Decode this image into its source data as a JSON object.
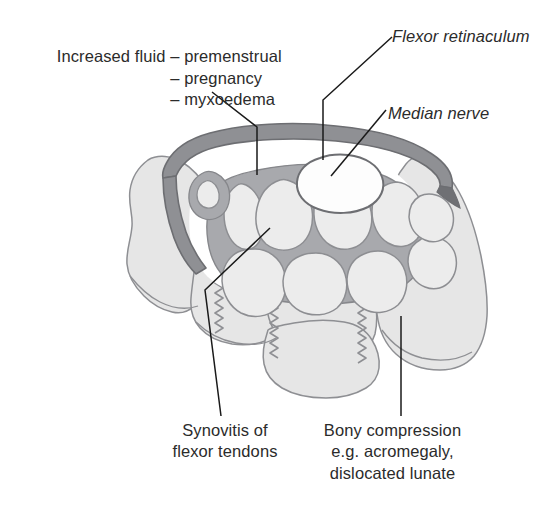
{
  "figure": {
    "type": "anatomical-cross-section"
  },
  "labels": {
    "increased_fluid": {
      "head": "Increased fluid",
      "items": [
        "– premenstrual",
        "– pregnancy",
        "– myxoedema"
      ],
      "items_text": "– premenstrual\n– pregnancy\n– myxoedema",
      "style": "plain"
    },
    "flexor_retinaculum": {
      "text": "Flexor retinaculum",
      "style": "italic"
    },
    "median_nerve": {
      "text": "Median nerve",
      "style": "italic"
    },
    "synovitis": {
      "text": "Synovitis of\nflexor tendons",
      "style": "plain"
    },
    "bony_compression": {
      "text": "Bony compression\ne.g. acromegaly,\ndislocated lunate",
      "style": "plain"
    }
  },
  "colors": {
    "background": "#ffffff",
    "text": "#2b2b2b",
    "leader_line": "#1a1a1a",
    "retinaculum_fill": "#8f9094",
    "retinaculum_stroke": "#6d6e72",
    "synovium_fill": "#a8a9ad",
    "synovium_stroke": "#86878b",
    "tendon_fill": "#ececec",
    "tendon_stroke": "#8d8e92",
    "nerve_fill": "#fdfdfd",
    "nerve_stroke": "#6d6e72",
    "bone_fill": "#e6e6e6",
    "bone_stroke": "#8e8f93",
    "suture_stroke": "#8e8f93",
    "tunnel_space": "#ffffff"
  },
  "anatomy": {
    "structures": [
      "flexor retinaculum",
      "median nerve",
      "flexor tendons",
      "synovium",
      "carpal bones",
      "inter-carpal sutures"
    ],
    "tendon_count": 11,
    "suture_count": 3
  }
}
